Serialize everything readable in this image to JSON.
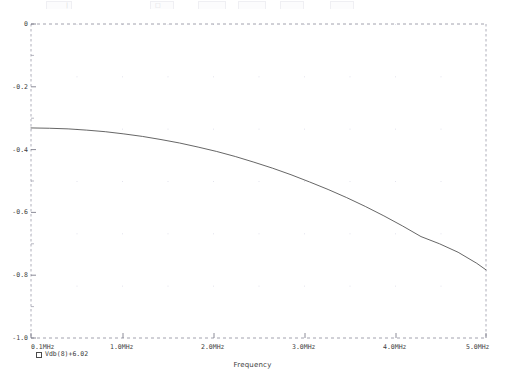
{
  "window": {
    "toolbar_visible_sliver": true,
    "toolbar_ghost_glyphs": [
      "|",
      "□"
    ]
  },
  "legend": {
    "marker": "square-marker",
    "label": "Vdb(8)+6.02"
  },
  "axis_title": {
    "x": "Frequency"
  },
  "colors": {
    "background": "#ffffff",
    "trace": "#4a4a4a",
    "axis": "#6b6b6b",
    "grid_dot": "#d8d8e4",
    "text": "#3d3d3d"
  },
  "chart_data": {
    "type": "line",
    "title": "",
    "xlabel": "Frequency",
    "ylabel": "",
    "grid": true,
    "legend_position": "below-left",
    "x_tick_labels": [
      "0.1MHz",
      "1.0MHz",
      "2.0MHz",
      "3.0MHz",
      "4.0MHz",
      "5.0MHz"
    ],
    "x_tick_values": [
      0.1,
      1.0,
      2.0,
      3.0,
      4.0,
      5.0
    ],
    "x_unit": "MHz",
    "xlim": [
      0.1,
      5.0
    ],
    "y_tick_labels": [
      "0",
      "-0.2",
      "-0.4",
      "-0.6",
      "-0.8",
      "-1.0"
    ],
    "y_tick_values": [
      0,
      -0.2,
      -0.4,
      -0.6,
      -0.8,
      -1.0
    ],
    "ylim": [
      -1.0,
      0
    ],
    "y_unit": "dB",
    "series": [
      {
        "name": "Vdb(8)+6.02",
        "x": [
          0.1,
          0.3,
          0.5,
          0.7,
          0.9,
          1.1,
          1.3,
          1.5,
          1.7,
          1.9,
          2.1,
          2.3,
          2.5,
          2.7,
          2.9,
          3.1,
          3.3,
          3.5,
          3.7,
          3.9,
          4.1,
          4.3,
          4.5,
          4.7,
          4.9,
          5.0
        ],
        "values": [
          -0.331,
          -0.332,
          -0.334,
          -0.338,
          -0.343,
          -0.35,
          -0.358,
          -0.368,
          -0.379,
          -0.392,
          -0.406,
          -0.422,
          -0.44,
          -0.459,
          -0.48,
          -0.503,
          -0.527,
          -0.553,
          -0.581,
          -0.611,
          -0.643,
          -0.677,
          -0.7,
          -0.727,
          -0.762,
          -0.783
        ]
      }
    ]
  }
}
